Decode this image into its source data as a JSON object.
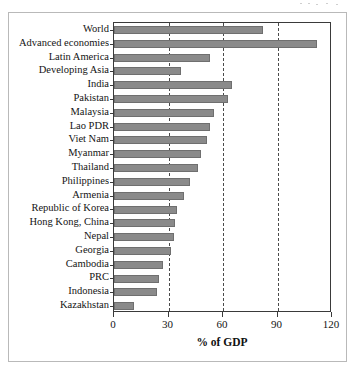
{
  "chart_data": {
    "type": "bar",
    "orientation": "horizontal",
    "title": "",
    "xlabel": "% of GDP",
    "ylabel": "",
    "xlim": [
      0,
      120
    ],
    "xticks": [
      0,
      30,
      60,
      90,
      120
    ],
    "grid": "vertical dashed at 30, 60, 90",
    "legend": "none",
    "bar_color": "#8a8a8a",
    "categories": [
      "World",
      "Advanced economies",
      "Latin America",
      "Developing Asia",
      "India",
      "Pakistan",
      "Malaysia",
      "Lao PDR",
      "Viet Nam",
      "Myanmar",
      "Thailand",
      "Philippines",
      "Armenia",
      "Republic of Korea",
      "Hong Kong, China",
      "Nepal",
      "Georgia",
      "Cambodia",
      "PRC",
      "Indonesia",
      "Kazakhstan"
    ],
    "values": [
      82,
      112,
      53,
      37,
      65,
      63,
      55,
      53,
      51,
      48,
      46,
      42,
      38.5,
      34.5,
      33.5,
      33,
      31.5,
      27,
      25,
      23.5,
      11
    ]
  },
  "axis": {
    "x_tick_labels": [
      "0",
      "30",
      "60",
      "90",
      "120"
    ],
    "x_axis_title": "% of GDP"
  }
}
